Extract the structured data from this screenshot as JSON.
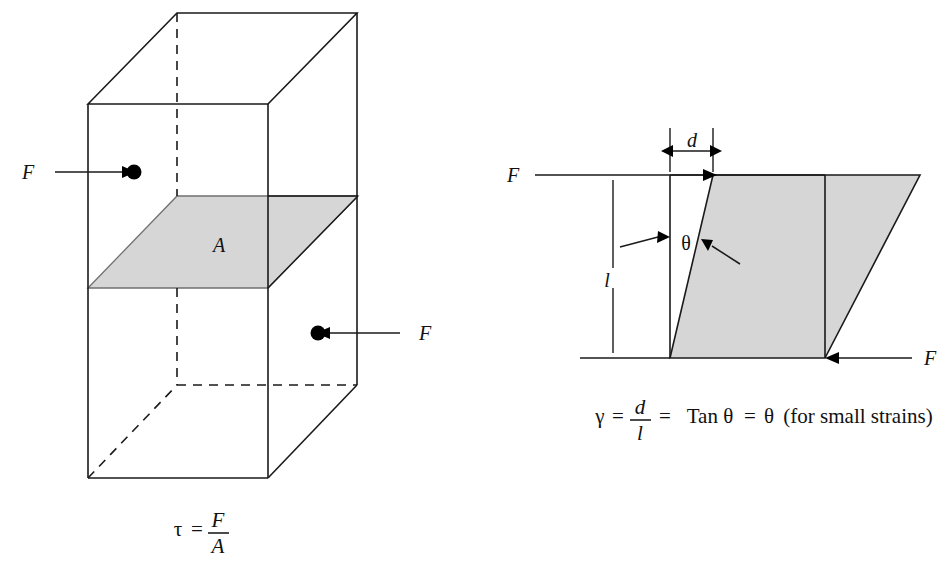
{
  "figure": {
    "domain": "Diagram",
    "background_color": "#ffffff",
    "line_color": "#1a1a1a",
    "shade_color": "#d6d6d6",
    "shade_edge_color": "#707070"
  },
  "left_diagram": {
    "name": "shear-stress-block",
    "description": "Rectangular 3D block in oblique projection with a shaded internal horizontal plane of area A and two opposing forces F",
    "area_label": "A",
    "force_label_left": "F",
    "force_label_right": "F",
    "hidden_edges_style": "dashed",
    "formula": {
      "symbol": "τ",
      "equals": "=",
      "numerator": "F",
      "denominator": "A",
      "full_text": "τ = F/A"
    }
  },
  "right_diagram": {
    "name": "shear-strain-parallelogram",
    "description": "Sheared parallelogram showing displacement d at top, original height l, shear angle theta, and opposing forces F",
    "displacement_label": "d",
    "height_label": "l",
    "angle_label": "θ",
    "force_label_top": "F",
    "force_label_bottom": "F",
    "formula": {
      "gamma": "γ",
      "eq1": "=",
      "numerator": "d",
      "denominator": "l",
      "eq2": "=",
      "tan_term": "Tan θ",
      "eq3": "=",
      "theta_term": "θ",
      "note": "(for small strains)",
      "full_text": "γ = d/l = Tan θ = θ (for small strains)"
    }
  }
}
